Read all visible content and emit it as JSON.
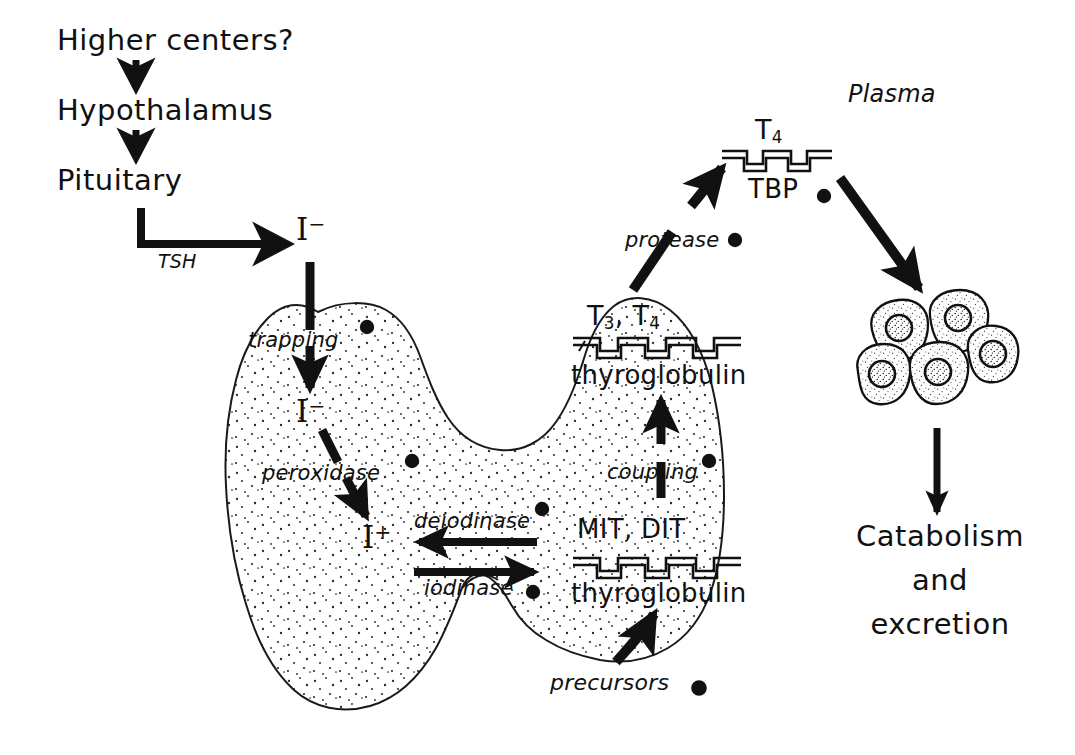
{
  "diagram": {
    "ink_color": "#111111",
    "background": "#ffffff"
  },
  "axis_chain": {
    "higher_centers": "Higher centers?",
    "hypothalamus": "Hypothalamus",
    "pituitary": "Pituitary",
    "tsh": "TSH"
  },
  "gland": {
    "iodide_plasma": "I",
    "iodide_plasma_charge": "−",
    "iodide_trapped": "I",
    "iodide_trapped_charge": "−",
    "iodine_active": "I",
    "iodine_active_charge": "+",
    "enzymes": {
      "trapping": "trapping",
      "peroxidase": "peroxidase",
      "deiodinase": "deiodinase",
      "iodinase": "iodinase",
      "coupling": "coupling",
      "protease": "protease",
      "precursors": "precursors"
    }
  },
  "colloid": {
    "mit_dit": "MIT, DIT",
    "thyroglobulin_lower": "thyroglobulin",
    "t3_t4": "T₃, T₄",
    "t3_label": "T",
    "t3_sub": "3",
    "t4_label": "T",
    "t4_sub": "4",
    "thyroglobulin_upper": "thyroglobulin"
  },
  "plasma": {
    "label": "Plasma",
    "t4": "T",
    "t4_sub": "4",
    "tbp": "TBP"
  },
  "target": {
    "cells_name": "target-cells",
    "catabolism_line1": "Catabolism",
    "catabolism_line2": "and",
    "catabolism_line3": "excretion"
  }
}
